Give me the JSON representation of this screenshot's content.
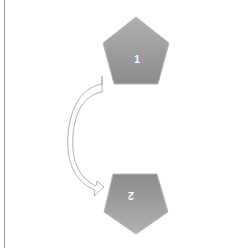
{
  "diagram": {
    "shapes": [
      {
        "id": "pentagon-1",
        "label": "1",
        "orientation": "upright"
      },
      {
        "id": "pentagon-2",
        "label": "2",
        "orientation": "inverted"
      }
    ],
    "connector": {
      "type": "curved-block-arrow",
      "from": "1",
      "to": "2"
    },
    "colors": {
      "shape_fill_top": "#a9a9a9",
      "shape_fill_bottom": "#8f8f8f",
      "shape_stroke": "#b5b5b5",
      "arrow_stroke": "#a0a0a0",
      "label": "#ffffff",
      "rule": "#9a9a9a"
    }
  }
}
